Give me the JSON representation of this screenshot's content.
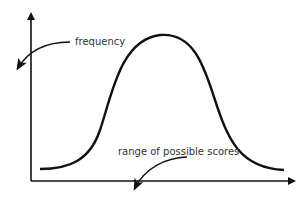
{
  "diagram": {
    "type": "bell-curve / normal distribution sketch",
    "labels": {
      "y_axis": "frequency",
      "x_axis": "range of possible scores"
    },
    "colors": {
      "line": "#111111",
      "text": "#333333",
      "background": "#ffffff"
    }
  }
}
